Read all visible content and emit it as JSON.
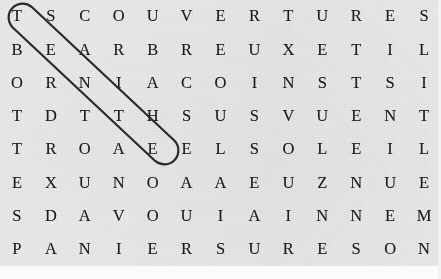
{
  "puzzle": {
    "kind": "word-search",
    "language": "French",
    "rows": 8,
    "cols": 13,
    "background_color": "#e7e7e7",
    "letter_color": "#1b1b1b",
    "grid": [
      [
        "T",
        "S",
        "C",
        "O",
        "U",
        "V",
        "E",
        "R",
        "T",
        "U",
        "R",
        "E",
        "S"
      ],
      [
        "B",
        "E",
        "A",
        "R",
        "B",
        "R",
        "E",
        "U",
        "X",
        "E",
        "T",
        "I",
        "L"
      ],
      [
        "O",
        "R",
        "N",
        "I",
        "A",
        "C",
        "O",
        "I",
        "N",
        "S",
        "T",
        "S",
        "I"
      ],
      [
        "T",
        "D",
        "T",
        "T",
        "H",
        "S",
        "U",
        "S",
        "V",
        "U",
        "E",
        "N",
        "T"
      ],
      [
        "T",
        "R",
        "O",
        "A",
        "E",
        "E",
        "L",
        "S",
        "O",
        "L",
        "E",
        "I",
        "L"
      ],
      [
        "E",
        "X",
        "U",
        "N",
        "O",
        "A",
        "A",
        "E",
        "U",
        "Z",
        "N",
        "U",
        "E"
      ],
      [
        "S",
        "D",
        "A",
        "V",
        "O",
        "U",
        "I",
        "A",
        "I",
        "N",
        "N",
        "E",
        "M"
      ],
      [
        "P",
        "A",
        "N",
        "I",
        "E",
        "R",
        "S",
        "U",
        "R",
        "E",
        "S",
        "O",
        "N"
      ]
    ],
    "row_strings": [
      "TSCOUVERTURES",
      "BEARBREUXETIL",
      "ORNIACOINSTSI",
      "TDTTHSUSVUENT",
      "TROAEELSOLEIL",
      "EXUNOAAEUZNUE",
      "SDAVOUIAINNEM",
      "PANIERSURESON"
    ]
  },
  "annotations": {
    "marker_color": "#2a2a2a",
    "marker_stroke_width": 2.2,
    "circled_words": [
      {
        "word": "TENTE",
        "direction": "diagonal-down-right",
        "start_row": 1,
        "start_col": 1,
        "end_row": 5,
        "end_col": 5,
        "letters": [
          "T",
          "E",
          "N",
          "T",
          "E"
        ],
        "shape": "capsule"
      }
    ]
  }
}
